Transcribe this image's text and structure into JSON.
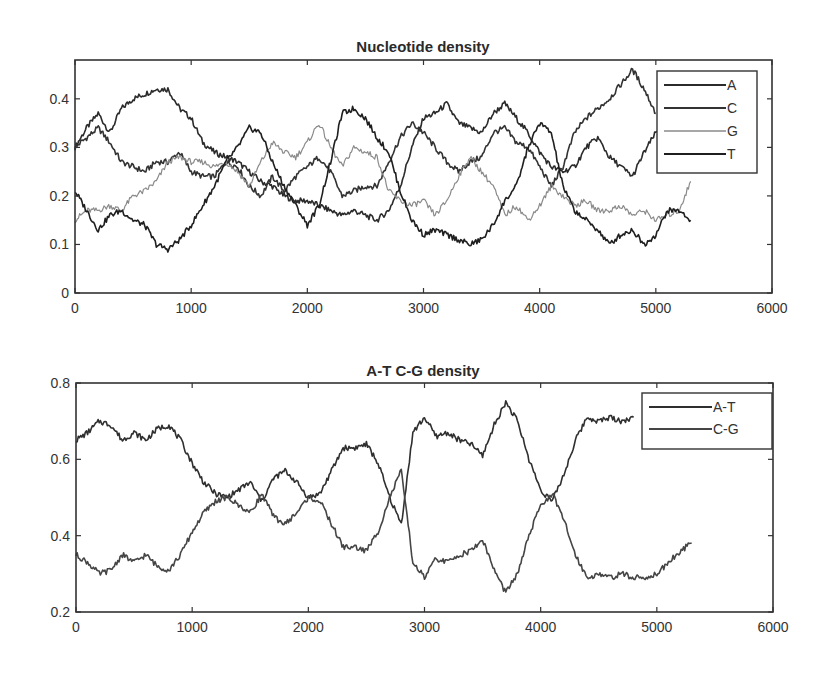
{
  "chart_data": [
    {
      "type": "line",
      "title": "Nucleotide density",
      "xlabel": "",
      "ylabel": "",
      "xlim": [
        0,
        6000
      ],
      "ylim": [
        0,
        0.48
      ],
      "xticks": [
        0,
        1000,
        2000,
        3000,
        4000,
        5000,
        6000
      ],
      "yticks": [
        0,
        0.1,
        0.2,
        0.3,
        0.4
      ],
      "xtick_labels": [
        "0",
        "1000",
        "2000",
        "3000",
        "4000",
        "5000",
        "6000"
      ],
      "ytick_labels": [
        "0",
        "0.1",
        "0.2",
        "0.3",
        "0.4"
      ],
      "grid": false,
      "legend_position": "upper right",
      "x": [
        0,
        100,
        200,
        300,
        400,
        500,
        600,
        700,
        800,
        900,
        1000,
        1100,
        1200,
        1300,
        1400,
        1500,
        1600,
        1700,
        1800,
        1900,
        2000,
        2100,
        2200,
        2300,
        2400,
        2500,
        2600,
        2700,
        2800,
        2900,
        3000,
        3100,
        3200,
        3300,
        3400,
        3500,
        3600,
        3700,
        3800,
        3900,
        4000,
        4100,
        4200,
        4300,
        4400,
        4500,
        4600,
        4700,
        4800,
        4900,
        5000,
        5100,
        5200,
        5300
      ],
      "series": [
        {
          "name": "A",
          "color": "#2b2b2b",
          "values": [
            0.3,
            0.34,
            0.37,
            0.33,
            0.38,
            0.4,
            0.41,
            0.42,
            0.42,
            0.38,
            0.36,
            0.31,
            0.29,
            0.28,
            0.27,
            0.25,
            0.23,
            0.22,
            0.2,
            0.19,
            0.19,
            0.18,
            0.17,
            0.16,
            0.17,
            0.16,
            0.15,
            0.17,
            0.22,
            0.3,
            0.36,
            0.37,
            0.39,
            0.35,
            0.34,
            0.33,
            0.37,
            0.39,
            0.36,
            0.33,
            0.29,
            0.26,
            0.25,
            0.26,
            0.3,
            0.32,
            0.28,
            0.26,
            0.24,
            0.29,
            0.33,
            0.35,
            0.34,
            0.35
          ]
        },
        {
          "name": "C",
          "color": "#333333",
          "values": [
            0.3,
            0.32,
            0.34,
            0.31,
            0.27,
            0.26,
            0.25,
            0.27,
            0.27,
            0.29,
            0.25,
            0.24,
            0.24,
            0.27,
            0.26,
            0.22,
            0.2,
            0.24,
            0.21,
            0.24,
            0.26,
            0.28,
            0.25,
            0.2,
            0.21,
            0.22,
            0.22,
            0.27,
            0.32,
            0.35,
            0.33,
            0.3,
            0.27,
            0.25,
            0.27,
            0.28,
            0.33,
            0.34,
            0.31,
            0.3,
            0.26,
            0.22,
            0.26,
            0.33,
            0.36,
            0.38,
            0.4,
            0.43,
            0.46,
            0.42,
            0.37,
            null,
            null,
            null
          ]
        },
        {
          "name": "G",
          "color": "#8a8a8a",
          "values": [
            0.15,
            0.17,
            0.17,
            0.18,
            0.17,
            0.2,
            0.21,
            0.23,
            0.27,
            0.28,
            0.27,
            0.27,
            0.26,
            0.27,
            0.25,
            0.22,
            0.27,
            0.31,
            0.29,
            0.28,
            0.31,
            0.35,
            0.3,
            0.26,
            0.3,
            0.29,
            0.28,
            0.21,
            0.19,
            0.18,
            0.19,
            0.16,
            0.19,
            0.24,
            0.28,
            0.25,
            0.22,
            0.16,
            0.18,
            0.15,
            0.18,
            0.22,
            0.2,
            0.18,
            0.19,
            0.17,
            0.17,
            0.18,
            0.16,
            0.17,
            0.15,
            0.16,
            0.17,
            0.23
          ]
        },
        {
          "name": "T",
          "color": "#1f1f1f",
          "values": [
            0.21,
            0.17,
            0.13,
            0.16,
            0.17,
            0.15,
            0.14,
            0.1,
            0.09,
            0.11,
            0.14,
            0.18,
            0.22,
            0.27,
            0.3,
            0.34,
            0.33,
            0.27,
            0.22,
            0.18,
            0.14,
            0.18,
            0.27,
            0.37,
            0.38,
            0.36,
            0.32,
            0.29,
            0.21,
            0.15,
            0.12,
            0.13,
            0.12,
            0.11,
            0.1,
            0.11,
            0.14,
            0.19,
            0.22,
            0.3,
            0.35,
            0.33,
            0.22,
            0.17,
            0.15,
            0.13,
            0.1,
            0.12,
            0.13,
            0.1,
            0.12,
            0.17,
            0.17,
            0.15
          ]
        }
      ]
    },
    {
      "type": "line",
      "title": "A-T C-G density",
      "xlabel": "",
      "ylabel": "",
      "xlim": [
        0,
        6000
      ],
      "ylim": [
        0.2,
        0.8
      ],
      "xticks": [
        0,
        1000,
        2000,
        3000,
        4000,
        5000,
        6000
      ],
      "yticks": [
        0.2,
        0.4,
        0.6,
        0.8
      ],
      "xtick_labels": [
        "0",
        "1000",
        "2000",
        "3000",
        "4000",
        "5000",
        "6000"
      ],
      "ytick_labels": [
        "0.2",
        "0.4",
        "0.6",
        "0.8"
      ],
      "grid": false,
      "legend_position": "upper right",
      "x": [
        0,
        100,
        200,
        300,
        400,
        500,
        600,
        700,
        800,
        900,
        1000,
        1100,
        1200,
        1300,
        1400,
        1500,
        1600,
        1700,
        1800,
        1900,
        2000,
        2100,
        2200,
        2300,
        2400,
        2500,
        2600,
        2700,
        2800,
        2900,
        3000,
        3100,
        3200,
        3300,
        3400,
        3500,
        3600,
        3700,
        3800,
        3900,
        4000,
        4100,
        4200,
        4300,
        4400,
        4500,
        4600,
        4700,
        4800,
        4900,
        5000,
        5100,
        5200,
        5300
      ],
      "series": [
        {
          "name": "A-T",
          "color": "#2f2f2f",
          "values": [
            0.65,
            0.67,
            0.7,
            0.69,
            0.65,
            0.67,
            0.65,
            0.68,
            0.69,
            0.65,
            0.59,
            0.54,
            0.51,
            0.5,
            0.52,
            0.54,
            0.49,
            0.55,
            0.57,
            0.54,
            0.5,
            0.51,
            0.57,
            0.63,
            0.63,
            0.64,
            0.59,
            0.5,
            0.43,
            0.67,
            0.71,
            0.66,
            0.67,
            0.65,
            0.64,
            0.61,
            0.69,
            0.75,
            0.7,
            0.6,
            0.52,
            0.49,
            0.56,
            0.65,
            0.71,
            0.7,
            0.71,
            0.7,
            0.71,
            null,
            null,
            null,
            null,
            null
          ]
        },
        {
          "name": "C-G",
          "color": "#454545",
          "values": [
            0.35,
            0.33,
            0.3,
            0.31,
            0.35,
            0.33,
            0.35,
            0.32,
            0.31,
            0.35,
            0.41,
            0.46,
            0.49,
            0.5,
            0.48,
            0.46,
            0.51,
            0.45,
            0.43,
            0.46,
            0.5,
            0.49,
            0.43,
            0.37,
            0.37,
            0.36,
            0.41,
            0.5,
            0.57,
            0.33,
            0.29,
            0.34,
            0.33,
            0.35,
            0.36,
            0.39,
            0.31,
            0.25,
            0.3,
            0.4,
            0.48,
            0.51,
            0.44,
            0.35,
            0.29,
            0.3,
            0.29,
            0.3,
            0.29,
            0.29,
            0.3,
            0.33,
            0.36,
            0.38
          ]
        }
      ]
    }
  ],
  "legend_top": [
    "A",
    "C",
    "G",
    "T"
  ],
  "legend_bottom": [
    "A-T",
    "C-G"
  ]
}
